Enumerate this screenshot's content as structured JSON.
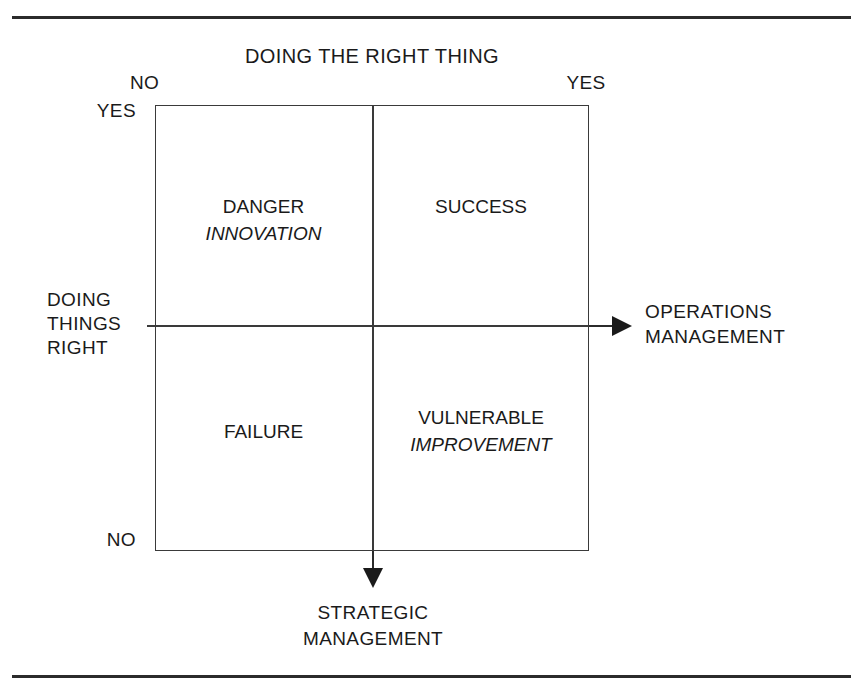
{
  "figure": {
    "top_rule": "horizontal-rule",
    "bottom_rule": "horizontal-rule",
    "axes": {
      "top_title": "DOING THE RIGHT THING",
      "top_left_label": "NO",
      "top_right_label": "YES",
      "left_title": "DOING\nTHINGS\nRIGHT",
      "left_top_label": "YES",
      "left_bottom_label": "NO",
      "right_title": "OPERATIONS\nMANAGEMENT",
      "bottom_title": "STRATEGIC\nMANAGEMENT"
    },
    "quadrants": [
      {
        "position": "top-left",
        "primary": "DANGER",
        "secondary": "INNOVATION"
      },
      {
        "position": "top-right",
        "primary": "SUCCESS",
        "secondary": ""
      },
      {
        "position": "bottom-left",
        "primary": "FAILURE",
        "secondary": ""
      },
      {
        "position": "bottom-right",
        "primary": "VULNERABLE",
        "secondary": "IMPROVEMENT"
      }
    ]
  },
  "chart_data": {
    "type": "table",
    "title": "",
    "xlabel": "DOING THE RIGHT THING",
    "ylabel": "DOING THINGS RIGHT",
    "x_categories": [
      "NO",
      "YES"
    ],
    "y_categories": [
      "YES",
      "NO"
    ],
    "x_axis_arrow_label": "OPERATIONS MANAGEMENT",
    "y_axis_arrow_label": "STRATEGIC MANAGEMENT",
    "grid": true,
    "cells": [
      {
        "x": "NO",
        "y": "YES",
        "label": "DANGER",
        "sublabel": "INNOVATION"
      },
      {
        "x": "YES",
        "y": "YES",
        "label": "SUCCESS",
        "sublabel": ""
      },
      {
        "x": "NO",
        "y": "NO",
        "label": "FAILURE",
        "sublabel": ""
      },
      {
        "x": "YES",
        "y": "NO",
        "label": "VULNERABLE",
        "sublabel": "IMPROVEMENT"
      }
    ],
    "colors": {
      "line": "#3a3a3a",
      "text": "#1a1a1a",
      "rule": "#2b2b2b",
      "background": "#ffffff"
    }
  }
}
